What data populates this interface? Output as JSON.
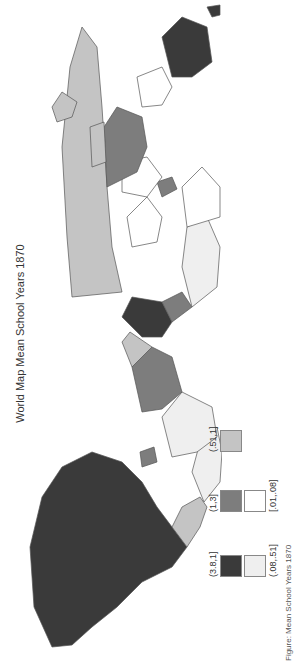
{
  "title": "World Map Mean School Years 1870",
  "legend": [
    {
      "label": "(3.8,1]",
      "color": "#3a3a3a"
    },
    {
      "label": "(1,3]",
      "color": "#7d7d7d"
    },
    {
      "label": "(.51,1]",
      "color": "#c4c4c4"
    },
    {
      "label": "(.08,.51]",
      "color": "#efefef"
    },
    {
      "label": "[.01,.08]",
      "color": "#ffffff"
    }
  ],
  "caption": "Figure: Mean School Years 1870",
  "colors": {
    "background": "#ffffff",
    "border": "#555555"
  }
}
